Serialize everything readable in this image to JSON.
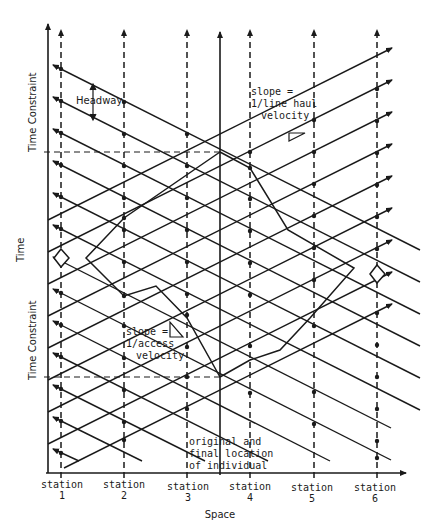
{
  "diagram": {
    "axes": {
      "y_label": "Time",
      "x_label": "Space"
    },
    "time_constraint_upper_label": "Time Constraint",
    "time_constraint_lower_label": "Time Constraint",
    "headway_label": "Headway",
    "line_haul_slope": {
      "line1": "slope =",
      "line2": "1/line haul",
      "line3": "velocity"
    },
    "access_slope": {
      "line1": "slope =",
      "line2": "1/access",
      "line3": "velocity"
    },
    "origin_label": {
      "line1": "original and",
      "line2": "final location",
      "line3": "of individual"
    },
    "stations": [
      {
        "label": "station",
        "number": "1"
      },
      {
        "label": "station",
        "number": "2"
      },
      {
        "label": "station",
        "number": "3"
      },
      {
        "label": "station",
        "number": "4"
      },
      {
        "label": "station",
        "number": "5"
      },
      {
        "label": "station",
        "number": "6"
      }
    ],
    "colors": {
      "ink": "#1a1a1a",
      "background": "#ffffff"
    }
  }
}
